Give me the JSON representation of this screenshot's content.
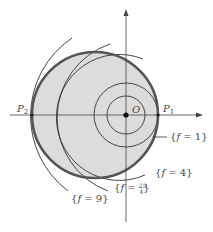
{
  "diagram": {
    "origin_label": "O",
    "point_labels": {
      "p1": "P",
      "p1_sub": "1",
      "p2": "P",
      "p2_sub": "2"
    },
    "level_curve_labels": [
      {
        "id": "f1",
        "open": "{",
        "var": "f",
        "eq": " = 1",
        "close": "}"
      },
      {
        "id": "f4",
        "open": "{",
        "var": "f",
        "eq": " = 4",
        "close": "}"
      },
      {
        "id": "f254",
        "open": "{",
        "var": "f",
        "eq": " = ",
        "frac_num": "25",
        "frac_den": "4",
        "close": "}"
      },
      {
        "id": "f9",
        "open": "{",
        "var": "f",
        "eq": " = 9",
        "close": "}"
      }
    ],
    "colors": {
      "disk_fill": "#dcdcdc",
      "disk_stroke": "#555555",
      "curve_stroke": "#333333",
      "axis": "#444444"
    }
  }
}
